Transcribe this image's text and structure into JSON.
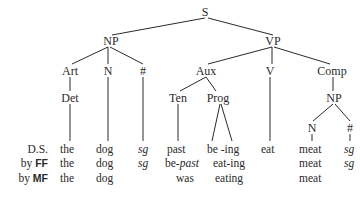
{
  "tree": {
    "root": "S",
    "nodes": {
      "S": "S",
      "NP": "NP",
      "VP": "VP",
      "Art": "Art",
      "N": "N",
      "hash": "#",
      "Aux": "Aux",
      "V": "V",
      "Comp": "Comp",
      "Det": "Det",
      "Ten": "Ten",
      "Prog": "Prog",
      "NP2": "NP",
      "N2": "N",
      "hash2": "#"
    }
  },
  "rows": [
    {
      "label_prefix": "",
      "label_bold": "D.S.",
      "cells": [
        "the",
        "dog",
        "sg",
        "past",
        "be -ing",
        "eat",
        "meat",
        "sg"
      ]
    },
    {
      "label_prefix": "by",
      "label_bold": "FF",
      "cells": [
        "the",
        "dog",
        "sg",
        "be-",
        "eat-ing",
        "meat",
        "sg"
      ],
      "italic_suffix": "past"
    },
    {
      "label_prefix": "by",
      "label_bold": "MF",
      "cells": [
        "the",
        "dog",
        "was",
        "eating",
        "meat"
      ]
    }
  ]
}
